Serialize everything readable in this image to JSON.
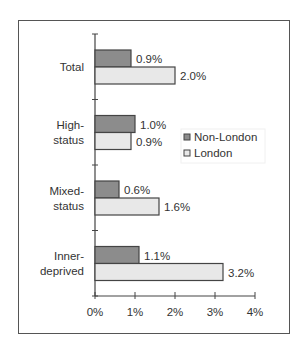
{
  "chart_data": {
    "type": "bar",
    "orientation": "horizontal",
    "title": "",
    "xlabel": "",
    "ylabel": "",
    "categories": [
      "Total",
      "High-status",
      "Mixed-status",
      "Inner-deprived"
    ],
    "category_lines": [
      [
        "Total"
      ],
      [
        "High-",
        "status"
      ],
      [
        "Mixed-",
        "status"
      ],
      [
        "Inner-",
        "deprived"
      ]
    ],
    "series": [
      {
        "name": "Non-London",
        "color": "#8c8c8c",
        "values": [
          0.9,
          1.0,
          0.6,
          1.1
        ],
        "labels": [
          "0.9%",
          "1.0%",
          "0.6%",
          "1.1%"
        ]
      },
      {
        "name": "London",
        "color": "#e8e8e8",
        "values": [
          2.0,
          0.9,
          1.6,
          3.2
        ],
        "labels": [
          "2.0%",
          "0.9%",
          "1.6%",
          "3.2%"
        ]
      }
    ],
    "xlim": [
      0,
      4
    ],
    "xticks": [
      "0%",
      "1%",
      "2%",
      "3%",
      "4%"
    ],
    "grid": false,
    "legend_position": "right-middle"
  }
}
